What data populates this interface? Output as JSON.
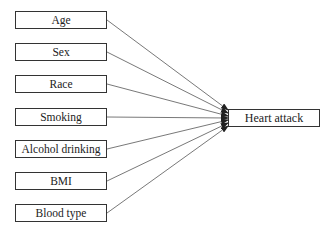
{
  "diagram": {
    "type": "flow",
    "factors": [
      {
        "id": "age",
        "label": "Age",
        "top": 11
      },
      {
        "id": "sex",
        "label": "Sex",
        "top": 43
      },
      {
        "id": "race",
        "label": "Race",
        "top": 75
      },
      {
        "id": "smoking",
        "label": "Smoking",
        "top": 108
      },
      {
        "id": "alcohol",
        "label": "Alcohol drinking",
        "top": 140
      },
      {
        "id": "bmi",
        "label": "BMI",
        "top": 172
      },
      {
        "id": "blood",
        "label": "Blood type",
        "top": 204
      }
    ],
    "outcome": {
      "id": "heart-attack",
      "label": "Heart attack"
    },
    "edges": [
      {
        "from": "age",
        "to": "heart-attack"
      },
      {
        "from": "sex",
        "to": "heart-attack"
      },
      {
        "from": "race",
        "to": "heart-attack"
      },
      {
        "from": "smoking",
        "to": "heart-attack"
      },
      {
        "from": "alcohol",
        "to": "heart-attack"
      },
      {
        "from": "bmi",
        "to": "heart-attack"
      },
      {
        "from": "blood",
        "to": "heart-attack"
      }
    ],
    "colors": {
      "line": "#333333",
      "box_border": "#333333",
      "background": "#ffffff"
    }
  }
}
